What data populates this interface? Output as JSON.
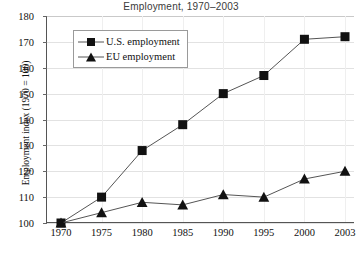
{
  "chart_data": {
    "type": "line",
    "title": "Employment, 1970–2003",
    "xlabel": "",
    "ylabel": "Employment index (1970 = 100)",
    "x": [
      1970,
      1975,
      1980,
      1985,
      1990,
      1995,
      2000,
      2003
    ],
    "xtick_labels": [
      "1970",
      "1975",
      "1980",
      "1985",
      "1990",
      "1995",
      "2000",
      "2003"
    ],
    "ytick_labels": [
      "100",
      "110",
      "120",
      "130",
      "140",
      "150",
      "160",
      "170",
      "180"
    ],
    "yticks": [
      100,
      110,
      120,
      130,
      140,
      150,
      160,
      170,
      180
    ],
    "ylim": [
      100,
      180
    ],
    "grid": "horizontal",
    "legend_position": "upper-left-inside",
    "series": [
      {
        "name": "U.S. employment",
        "marker": "square",
        "values": [
          100,
          110,
          128,
          138,
          150,
          157,
          171,
          172
        ]
      },
      {
        "name": "EU employment",
        "marker": "triangle",
        "values": [
          100,
          104,
          108,
          107,
          111,
          110,
          117,
          120
        ]
      }
    ]
  },
  "legend": {
    "items": [
      {
        "label": "U.S. employment",
        "marker": "square-marker-icon"
      },
      {
        "label": "EU employment",
        "marker": "triangle-marker-icon"
      }
    ]
  },
  "colors": {
    "series_line": "#555555",
    "marker_fill": "#111111",
    "gridline": "#e2e2e2",
    "axis": "#555555",
    "title_text": "#3a3a3a",
    "tick_text": "#111111"
  }
}
